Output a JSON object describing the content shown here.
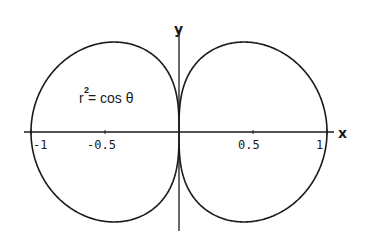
{
  "chart_data": {
    "type": "line",
    "subtype": "polar-curve",
    "title": "",
    "equation": "r^2 = cos θ",
    "annotation": {
      "base": "r",
      "superscript": "2",
      "rest": " = cos θ"
    },
    "xlabel": "x",
    "ylabel": "y",
    "xlim": [
      -1.05,
      1.05
    ],
    "ylim": [
      -0.7,
      0.7
    ],
    "x_ticks": [
      {
        "value": -1,
        "label": "-1"
      },
      {
        "value": -0.5,
        "label": "-0.5"
      },
      {
        "value": 0.5,
        "label": "0.5"
      },
      {
        "value": 1,
        "label": "1"
      }
    ],
    "grid": false,
    "legend": null,
    "series": [
      {
        "name": "r^2 = cos θ (r ≥ 0 branch, right lobe)",
        "description": "Lemniscate-like figure-eight lobe on right, x from 0 to 1, max |y| ≈ 0.62"
      },
      {
        "name": "r^2 = cos θ (r ≤ 0 branch, left lobe)",
        "description": "Mirror lobe on left, x from -1 to 0"
      }
    ],
    "key_points": [
      {
        "x": 1,
        "y": 0
      },
      {
        "x": -1,
        "y": 0
      },
      {
        "x": 0,
        "y": 0
      },
      {
        "x": 0.577,
        "y": 0.62
      },
      {
        "x": 0.577,
        "y": -0.62
      },
      {
        "x": -0.577,
        "y": 0.62
      },
      {
        "x": -0.577,
        "y": -0.62
      }
    ],
    "stroke_color": "#1a1a1a"
  }
}
